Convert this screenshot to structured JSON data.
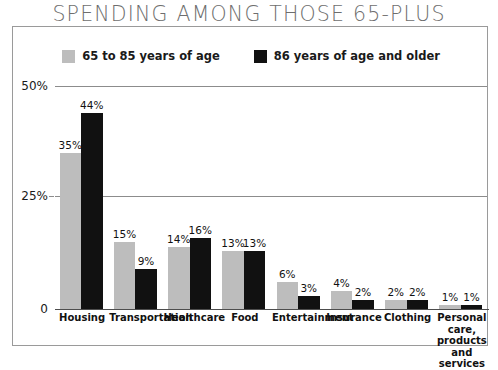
{
  "chart_data": {
    "type": "bar",
    "title": "SPENDING AMONG THOSE 65-PLUS",
    "xlabel": "",
    "ylabel": "",
    "ylim": [
      0,
      50
    ],
    "grid": true,
    "legend_position": "top-center",
    "ytick_labels": [
      "50%",
      "25%",
      "0"
    ],
    "ytick_values": [
      50,
      25,
      0
    ],
    "categories": [
      "Housing",
      "Transportation",
      "Healthcare",
      "Food",
      "Entertainment",
      "Insurance",
      "Clothing",
      "Personal care, products and services"
    ],
    "series": [
      {
        "name": "65 to 85 years of age",
        "color": "#bdbdbd",
        "values": [
          35,
          15,
          14,
          13,
          6,
          4,
          2,
          1
        ],
        "value_labels": [
          "35%",
          "15%",
          "14%",
          "13%",
          "6%",
          "4%",
          "2%",
          "1%"
        ]
      },
      {
        "name": "86 years of age and older",
        "color": "#111111",
        "values": [
          44,
          9,
          16,
          13,
          3,
          2,
          2,
          1
        ],
        "value_labels": [
          "44%",
          "9%",
          "16%",
          "13%",
          "3%",
          "2%",
          "2%",
          "1%"
        ]
      }
    ]
  },
  "legend": {
    "items": [
      {
        "label": "65 to 85 years of age",
        "color": "#bdbdbd"
      },
      {
        "label": "86 years of age and older",
        "color": "#111111"
      }
    ]
  },
  "colors": {
    "series_light": "#bdbdbd",
    "series_dark": "#111111",
    "frame": "#9a9a9a",
    "gridline": "#8c8c8c",
    "title": "#6e6e6e",
    "text": "#111111"
  }
}
